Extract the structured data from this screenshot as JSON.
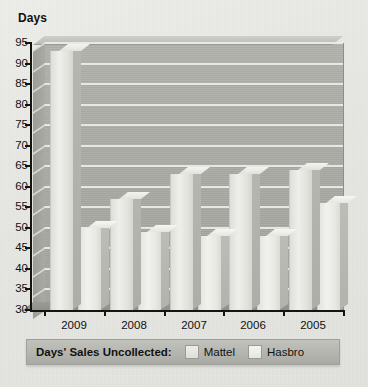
{
  "chart_data": {
    "type": "bar",
    "title": "",
    "ylabel": "Days",
    "xlabel": "",
    "categories": [
      "2009",
      "2008",
      "2007",
      "2006",
      "2005"
    ],
    "series": [
      {
        "name": "Mattel",
        "values": [
          93,
          57,
          63,
          63,
          64
        ]
      },
      {
        "name": "Hasbro",
        "values": [
          50,
          49,
          48,
          48,
          56
        ]
      }
    ],
    "ylim": [
      30,
      95
    ],
    "yticks": [
      95,
      90,
      85,
      80,
      75,
      70,
      65,
      60,
      55,
      50,
      45,
      40,
      35,
      30
    ],
    "grid": true,
    "legend_position": "bottom",
    "legend_title": "Days' Sales Uncollected:",
    "style": "3d-clustered-column"
  },
  "legend": {
    "title": "Days' Sales Uncollected:",
    "entries": [
      {
        "label": "Mattel",
        "swatch": "mattel-swatch"
      },
      {
        "label": "Hasbro",
        "swatch": "hasbro-swatch"
      }
    ]
  },
  "axis": {
    "y_title": "Days"
  }
}
